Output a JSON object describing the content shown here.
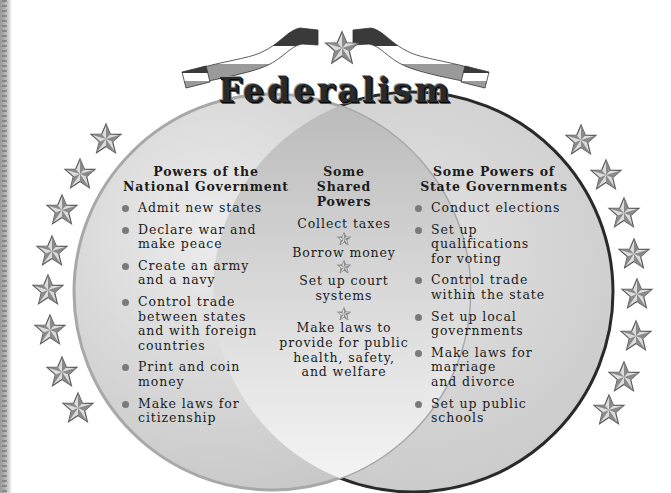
{
  "title": "Federalism",
  "colors": {
    "left_circle_fill": "#cfcfcf",
    "left_circle_stroke": "#a9a9a9",
    "right_circle_fill": "#d2d2d2",
    "right_circle_stroke": "#2a2a2a",
    "overlap_fill": "#e6e6e6",
    "star": "#8a8a8a",
    "text": "#1c1c1c"
  },
  "national": {
    "heading": "Powers of the\nNational Government",
    "items": [
      "Admit new states",
      "Declare war and\nmake peace",
      "Create an army\nand a navy",
      "Control trade\nbetween states\nand with foreign\ncountries",
      "Print and coin\nmoney",
      "Make laws for\ncitizenship"
    ]
  },
  "shared": {
    "heading": "Some\nShared\nPowers",
    "items": [
      "Collect taxes",
      "Borrow money",
      "Set up court\nsystems",
      "Make laws to\nprovide for public\nhealth, safety,\nand welfare"
    ]
  },
  "state": {
    "heading": "Some Powers of\nState Governments",
    "items": [
      "Conduct elections",
      "Set up\nqualifications\nfor voting",
      "Control trade\nwithin the state",
      "Set up local\ngovernments",
      "Make laws for\nmarriage\nand divorce",
      "Set up public\nschools"
    ]
  },
  "decorations": {
    "left_stars": 8,
    "right_stars": 8,
    "banner_star": 1
  }
}
